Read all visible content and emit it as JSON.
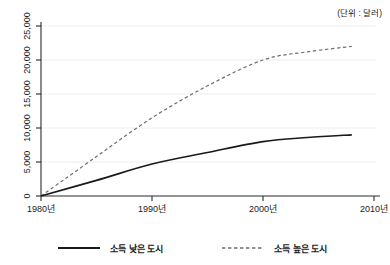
{
  "chart_data": {
    "type": "line",
    "title": "",
    "subtitle": "",
    "unit_note": "(단위 : 달러)",
    "xlabel": "",
    "ylabel": "",
    "xlim": [
      1980,
      2010
    ],
    "ylim": [
      0,
      25000
    ],
    "grid": "horizontal",
    "legend_position": "bottom",
    "x_tick_labels": [
      "1980년",
      "1990년",
      "2000년",
      "2010년"
    ],
    "x_ticks": [
      1980,
      1990,
      2000,
      2010
    ],
    "y_tick_labels": [
      "0",
      "5,000",
      "10,000",
      "15,000",
      "20,000",
      "25,000"
    ],
    "y_ticks": [
      0,
      5000,
      10000,
      15000,
      20000,
      25000
    ],
    "series": [
      {
        "name": "소득 낮은 도시",
        "style": "solid",
        "color": "#1a1a1a",
        "x": [
          1980,
          1985,
          1990,
          1995,
          2000,
          2004,
          2008
        ],
        "values": [
          0,
          2300,
          4700,
          6400,
          8000,
          8600,
          9000
        ]
      },
      {
        "name": "소득 높은 도시",
        "style": "dashed",
        "color": "#6e6e6e",
        "x": [
          1980,
          1985,
          1990,
          1995,
          2000,
          2004,
          2008
        ],
        "values": [
          0,
          5800,
          11500,
          16200,
          20000,
          21200,
          22000
        ]
      }
    ]
  },
  "legend": {
    "items": [
      {
        "label": "소득 낮은 도시",
        "style": "solid"
      },
      {
        "label": "소득 높은 도시",
        "style": "dashed"
      }
    ]
  }
}
